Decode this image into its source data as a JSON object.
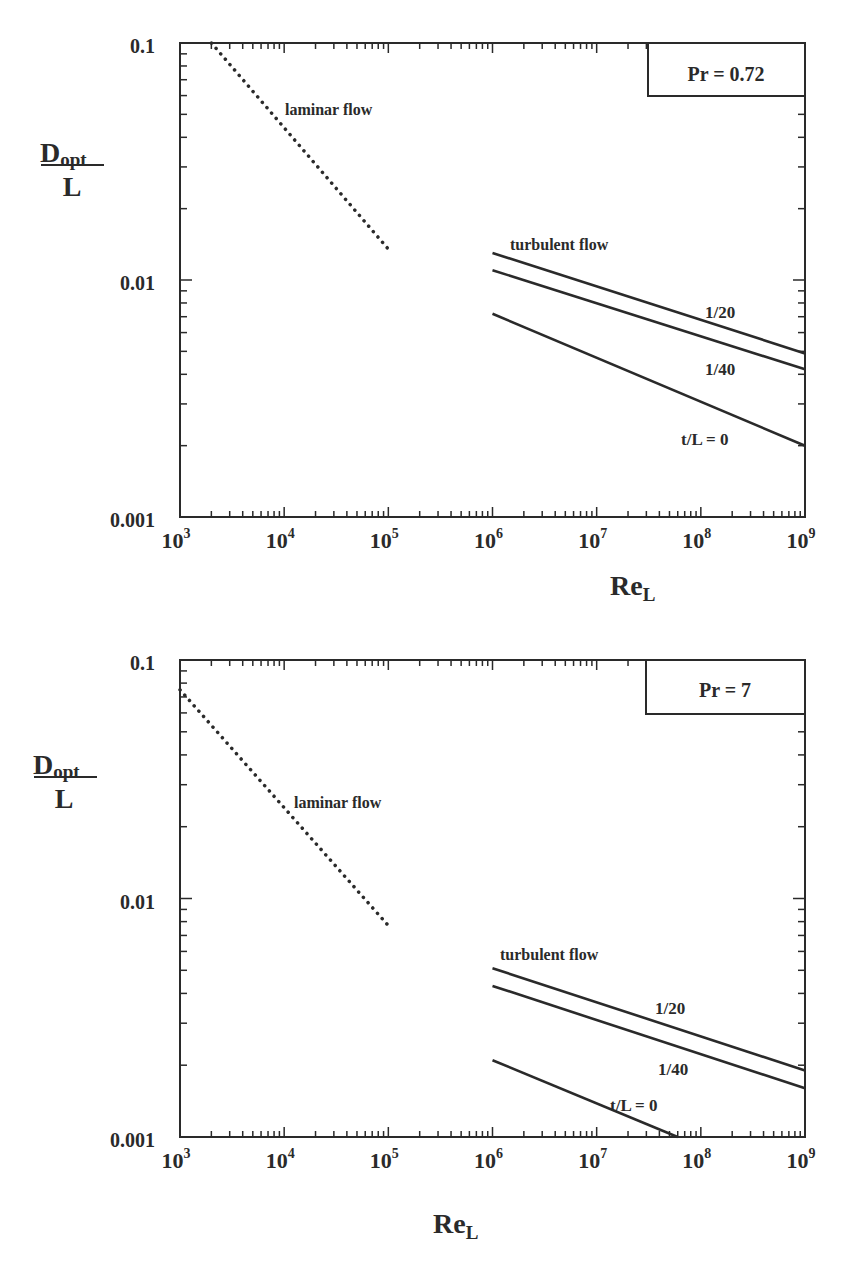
{
  "chart_data": [
    {
      "type": "line",
      "scale": {
        "x": "log",
        "y": "log"
      },
      "xlabel": "Re_L",
      "ylabel": "D_opt / L",
      "xlim": [
        1000,
        1000000000
      ],
      "ylim": [
        0.001,
        0.1
      ],
      "x_tick_labels": [
        "10^3",
        "10^4",
        "10^5",
        "10^6",
        "10^7",
        "10^8",
        "10^9"
      ],
      "y_tick_labels": [
        "0.001",
        "0.01",
        "0.1"
      ],
      "grid": false,
      "annotation_box": "Pr = 0.72",
      "annotations": [
        "laminar flow",
        "turbulent flow",
        "1/20",
        "1/40",
        "t/L = 0"
      ],
      "series": [
        {
          "name": "laminar flow",
          "style": "dotted",
          "x": [
            2000,
            100000
          ],
          "y": [
            0.1,
            0.0135
          ]
        },
        {
          "name": "turbulent t/L = 1/20",
          "style": "solid",
          "x": [
            1000000,
            1000000000
          ],
          "y": [
            0.013,
            0.0049
          ]
        },
        {
          "name": "turbulent t/L = 1/40",
          "style": "solid",
          "x": [
            1000000,
            1000000000
          ],
          "y": [
            0.011,
            0.0042
          ]
        },
        {
          "name": "turbulent t/L = 0",
          "style": "solid",
          "x": [
            1000000,
            1000000000
          ],
          "y": [
            0.0072,
            0.002
          ]
        }
      ]
    },
    {
      "type": "line",
      "scale": {
        "x": "log",
        "y": "log"
      },
      "xlabel": "Re_L",
      "ylabel": "D_opt / L",
      "xlim": [
        1000,
        1000000000
      ],
      "ylim": [
        0.001,
        0.1
      ],
      "x_tick_labels": [
        "10^3",
        "10^4",
        "10^5",
        "10^6",
        "10^7",
        "10^8",
        "10^9"
      ],
      "y_tick_labels": [
        "0.001",
        "0.01",
        "0.1"
      ],
      "grid": false,
      "annotation_box": "Pr = 7",
      "annotations": [
        "laminar flow",
        "turbulent flow",
        "1/20",
        "1/40",
        "t/L = 0"
      ],
      "series": [
        {
          "name": "laminar flow",
          "style": "dotted",
          "x": [
            1000,
            100000
          ],
          "y": [
            0.075,
            0.0077
          ]
        },
        {
          "name": "turbulent t/L = 1/20",
          "style": "solid",
          "x": [
            1000000,
            1000000000
          ],
          "y": [
            0.0051,
            0.0019
          ]
        },
        {
          "name": "turbulent t/L = 1/40",
          "style": "solid",
          "x": [
            1000000,
            1000000000
          ],
          "y": [
            0.0043,
            0.0016
          ]
        },
        {
          "name": "turbulent t/L = 0",
          "style": "solid",
          "x": [
            1000000,
            60000000
          ],
          "y": [
            0.0021,
            0.001
          ]
        }
      ]
    }
  ],
  "plots": [
    {
      "pr_label": "Pr = 0.72",
      "y_labels": [
        "0.1",
        "0.01",
        "0.001"
      ],
      "x_base": "10",
      "x_exps": [
        "3",
        "4",
        "5",
        "6",
        "7",
        "8",
        "9"
      ],
      "ylabel_num": "D",
      "ylabel_sub": "opt",
      "ylabel_den": "L",
      "xlabel_main": "Re",
      "xlabel_sub": "L",
      "laminar_label": "laminar flow",
      "turbulent_label": "turbulent flow",
      "curve_labels": [
        "1/20",
        "1/40",
        "t/L = 0"
      ]
    },
    {
      "pr_label": "Pr = 7",
      "y_labels": [
        "0.1",
        "0.01",
        "0.001"
      ],
      "x_base": "10",
      "x_exps": [
        "3",
        "4",
        "5",
        "6",
        "7",
        "8",
        "9"
      ],
      "ylabel_num": "D",
      "ylabel_sub": "opt",
      "ylabel_den": "L",
      "xlabel_main": "Re",
      "xlabel_sub": "L",
      "laminar_label": "laminar flow",
      "turbulent_label": "turbulent flow",
      "curve_labels": [
        "1/20",
        "1/40",
        "t/L = 0"
      ]
    }
  ],
  "colors": {
    "ink": "#2a2a2a",
    "background": "#ffffff"
  }
}
